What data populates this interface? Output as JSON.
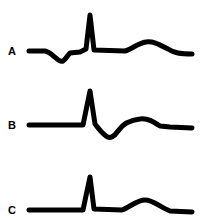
{
  "figure": {
    "stroke_color": "#000000",
    "background_color": "#ffffff",
    "traces": [
      {
        "label": "A",
        "label_top": 46,
        "path": "M29,51 L45,51 C50,52 53,56 56,58 C59,61 61,62 63,61 C66,59 67,56 70,53 L80,52 L86,49 L90,15 L94,50 L125,51 C132,49 138,43 146,42 C154,41 160,45 168,49 C174,53 180,54 192,54"
      },
      {
        "label": "B",
        "label_top": 120,
        "path": "M29,125 L83,125 L90,91 L95,124 C98,128 102,133 106,136 C110,139 114,137 118,131 C122,125 130,120 140,119 C148,118 154,122 160,126 L170,127 L192,128"
      },
      {
        "label": "C",
        "label_top": 205,
        "path": "M29,210 L83,210 L90,177 L94,209 L122,210 C130,207 137,200 145,200 C153,200 160,207 170,211 L192,212"
      }
    ]
  }
}
